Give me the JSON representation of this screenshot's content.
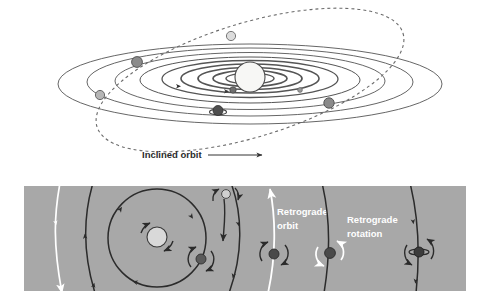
{
  "figure": {
    "name": "orbital-motion-diagram",
    "background_color": "#ffffff"
  },
  "top_panel": {
    "name": "solar-system-inclined-orbit-panel",
    "background_color": "#ffffff",
    "sun": {
      "label": "sun",
      "color": "#f5f5f3",
      "stroke": "#4a4a4a"
    },
    "orbit_stroke": "#555555",
    "inclined_orbit": {
      "label": "Inclined orbit",
      "style": "dashed",
      "stroke": "#6b6b6b",
      "body_color": "#c9c9c9"
    },
    "planets": [
      {
        "name": "planet-outer-left-upper",
        "color": "#8c8c8c"
      },
      {
        "name": "planet-outer-left-lower",
        "color": "#b5b5b5"
      },
      {
        "name": "planet-ringed-lower-mid",
        "color": "#4f4f4f"
      },
      {
        "name": "planet-inner-left",
        "color": "#6f6f6f"
      },
      {
        "name": "planet-inner-right-small",
        "color": "#9a9a9a"
      },
      {
        "name": "planet-mid-right",
        "color": "#a0a0a0"
      },
      {
        "name": "planet-outer-right",
        "color": "#7d7d7d"
      }
    ],
    "annotations": [
      {
        "name": "inclined-orbit-label",
        "text": "Inclined orbit"
      }
    ]
  },
  "bottom_panel": {
    "name": "retrograde-motion-panel",
    "background_color": "#a8a8a8",
    "prograde_arrow_color": "#2b2b2b",
    "retrograde_arrow_color": "#ffffff",
    "central_star": {
      "label": "star",
      "color": "#d9d9d9",
      "stroke": "#3a3a3a"
    },
    "annotations": [
      {
        "name": "retrograde-orbit-label",
        "text": "Retrograde",
        "text2": "orbit"
      },
      {
        "name": "retrograde-rotation-label",
        "text": "Retrograde",
        "text2": "rotation"
      }
    ],
    "labels": {
      "retrograde_orbit_line1": "Retrograde",
      "retrograde_orbit_line2": "orbit",
      "retrograde_rotation_line1": "Retrograde",
      "retrograde_rotation_line2": "rotation"
    },
    "bodies": [
      {
        "name": "orbiting-planet-with-moon",
        "color": "#5a5a5a"
      },
      {
        "name": "small-moon-top",
        "color": "#d0d0d0"
      },
      {
        "name": "retrograde-orbit-planet",
        "color": "#4a4a4a"
      },
      {
        "name": "retrograde-rotation-planet",
        "color": "#4a4a4a"
      },
      {
        "name": "tilted-axis-planet",
        "color": "#3c3c3c"
      }
    ]
  }
}
